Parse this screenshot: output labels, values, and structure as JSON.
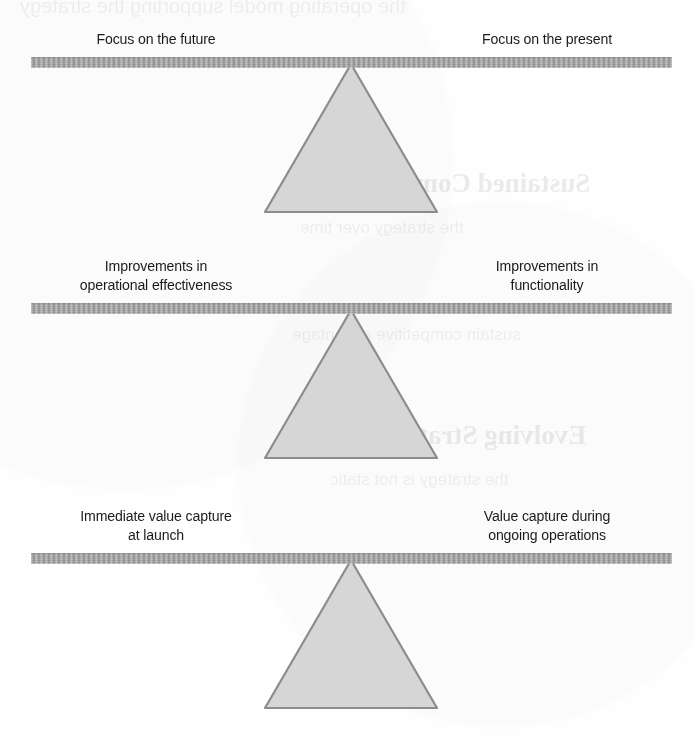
{
  "figure": {
    "type": "diagram",
    "kind": "balance-scale-trade-offs",
    "count": 3,
    "colors": {
      "bar": "#9a9a9a",
      "fulcrum_fill": "#d6d6d6",
      "fulcrum_stroke": "#8c8c8c",
      "text": "#1b1b1b",
      "background": "#ffffff"
    }
  },
  "balances": [
    {
      "id": "balance-1",
      "left_label": {
        "lines": [
          "Focus on the future"
        ]
      },
      "right_label": {
        "lines": [
          "Focus on the present"
        ]
      }
    },
    {
      "id": "balance-2",
      "left_label": {
        "lines": [
          "Improvements in",
          "operational effectiveness"
        ]
      },
      "right_label": {
        "lines": [
          "Improvements in",
          "functionality"
        ]
      }
    },
    {
      "id": "balance-3",
      "left_label": {
        "lines": [
          "Immediate value capture",
          "at launch"
        ]
      },
      "right_label": {
        "lines": [
          "Value capture during",
          "ongoing operations"
        ]
      }
    }
  ],
  "bleed_through": {
    "note": "Faint mirrored text showing through from the reverse side of the scanned page",
    "fragments": [
      "the operating model supporting the strategy",
      "Sustained Competitive",
      "the strategy over time",
      "sustain competitive advantage",
      "Evolving Strategy",
      "the strategy is not static"
    ]
  }
}
